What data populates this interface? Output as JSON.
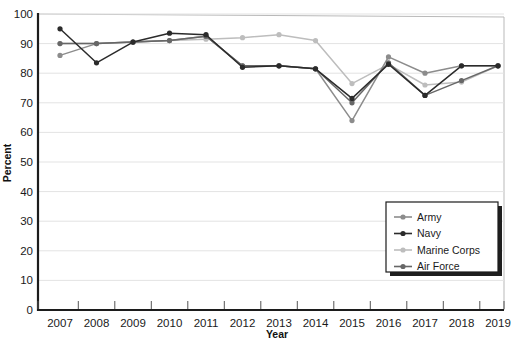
{
  "chart_data": {
    "type": "line",
    "title": "",
    "xlabel": "Year",
    "ylabel": "Percent",
    "x": [
      2007,
      2008,
      2009,
      2010,
      2011,
      2012,
      2013,
      2014,
      2015,
      2016,
      2017,
      2018,
      2019
    ],
    "xtick_labels": [
      "2007",
      "2008",
      "2009",
      "2010",
      "2011",
      "2012",
      "2013",
      "2014",
      "2015",
      "2016",
      "2017",
      "2018",
      "2019"
    ],
    "ytick_labels": [
      "0",
      "10",
      "20",
      "30",
      "40",
      "50",
      "60",
      "70",
      "80",
      "90",
      "100"
    ],
    "ytick_values": [
      0,
      10,
      20,
      30,
      40,
      50,
      60,
      70,
      80,
      90,
      100
    ],
    "ylim": [
      0,
      100
    ],
    "xlim": [
      2007,
      2019
    ],
    "grid": true,
    "grid_axis": "y",
    "legend_position": "bottom-right",
    "series": [
      {
        "name": "Army",
        "color": "#8c8c8c",
        "values": [
          86,
          90,
          90.5,
          91,
          92.5,
          82.5,
          82.5,
          81.5,
          64,
          85.5,
          80,
          82.5,
          82.5
        ]
      },
      {
        "name": "Navy",
        "color": "#2b2b2b",
        "values": [
          95,
          83.5,
          90.5,
          93.5,
          93,
          82,
          82.5,
          81.5,
          71.5,
          83,
          72.5,
          82.5,
          82.5
        ]
      },
      {
        "name": "Marine Corps",
        "color": "#bdbdbd",
        "values": [
          90,
          90,
          90.5,
          91,
          91.5,
          92,
          93,
          91,
          76.5,
          83,
          76,
          77,
          82.5
        ]
      },
      {
        "name": "Air Force",
        "color": "#676767",
        "values": [
          90,
          90,
          90.5,
          91,
          92.5,
          82.5,
          82.5,
          81.5,
          70,
          83.5,
          72.5,
          77.5,
          82.5
        ]
      }
    ]
  },
  "legend": {
    "items": [
      {
        "label": "Army"
      },
      {
        "label": "Navy"
      },
      {
        "label": "Marine Corps"
      },
      {
        "label": "Air Force"
      }
    ]
  },
  "axes": {
    "y_title": "Percent",
    "x_title": "Year"
  }
}
